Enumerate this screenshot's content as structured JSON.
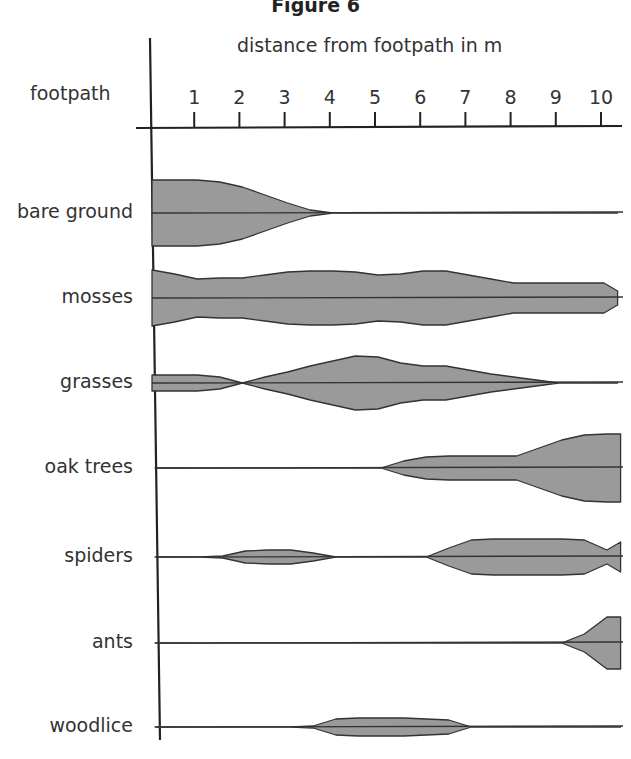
{
  "chart_data": {
    "type": "kite diagram",
    "title": "Figure 6",
    "xlabel": "distance from footpath in m",
    "origin_label": "footpath",
    "x_ticks": [
      1,
      2,
      3,
      4,
      5,
      6,
      7,
      8,
      9,
      10
    ],
    "xlim": [
      0,
      10.3
    ],
    "x": [
      0,
      0.5,
      1,
      1.5,
      2,
      2.5,
      3,
      3.5,
      4,
      4.5,
      5,
      5.5,
      6,
      6.5,
      7,
      7.5,
      8,
      8.5,
      9,
      9.5,
      10,
      10.3
    ],
    "series": [
      {
        "name": "bare ground",
        "half_width": [
          33,
          33,
          33,
          31,
          26,
          18,
          10,
          3,
          0,
          0,
          0,
          0,
          0,
          0,
          0,
          0,
          0,
          0,
          0,
          0,
          0,
          0
        ]
      },
      {
        "name": "mosses",
        "half_width": [
          28,
          24,
          19,
          20,
          20,
          23,
          26,
          27,
          27,
          26,
          23,
          24,
          27,
          27,
          23,
          19,
          15,
          15,
          15,
          15,
          15,
          7
        ]
      },
      {
        "name": "grasses",
        "half_width": [
          8,
          8,
          8,
          6,
          0,
          6,
          11,
          17,
          22,
          27,
          26,
          20,
          17,
          17,
          13,
          9,
          6,
          3,
          0,
          0,
          0,
          0
        ]
      },
      {
        "name": "oak trees",
        "half_width": [
          0,
          0,
          0,
          0,
          0,
          0,
          0,
          0,
          0,
          0,
          0,
          7,
          11,
          12,
          12,
          12,
          12,
          20,
          28,
          33,
          34,
          34
        ]
      },
      {
        "name": "spiders",
        "half_width": [
          0,
          0,
          0,
          1,
          6,
          7,
          7,
          4,
          0,
          0,
          0,
          0,
          0,
          9,
          17,
          18,
          18,
          18,
          18,
          17,
          7,
          15
        ]
      },
      {
        "name": "ants",
        "half_width": [
          0,
          0,
          0,
          0,
          0,
          0,
          0,
          0,
          0,
          0,
          0,
          0,
          0,
          0,
          0,
          0,
          0,
          0,
          0,
          9,
          26,
          26
        ]
      },
      {
        "name": "woodlice",
        "half_width": [
          0,
          0,
          0,
          0,
          0,
          0,
          0,
          1,
          8,
          9,
          9,
          9,
          8,
          7,
          0,
          0,
          0,
          0,
          0,
          0,
          0,
          0
        ]
      }
    ],
    "grid": false,
    "legend": "none",
    "fill_color": "#9a9a9a",
    "line_color": "#333333"
  }
}
